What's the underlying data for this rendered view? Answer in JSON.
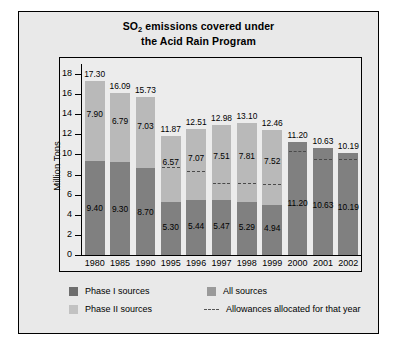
{
  "chart_data": {
    "type": "bar",
    "title": "SO2 emissions covered under the Acid Rain Program",
    "title_line1_pre": "SO",
    "title_line1_sub": "2",
    "title_line1_post": " emissions covered under",
    "title_line2": "the Acid Rain Program",
    "xlabel": "",
    "ylabel": "Million Tons",
    "ylim": [
      0,
      19
    ],
    "yticks": [
      0,
      2,
      4,
      6,
      8,
      10,
      12,
      14,
      16,
      18
    ],
    "grid": false,
    "legend_position": "bottom",
    "categories": [
      "1980",
      "1985",
      "1990",
      "1995",
      "1996",
      "1997",
      "1998",
      "1999",
      "2000",
      "2001",
      "2002"
    ],
    "series": [
      {
        "name": "Phase I sources",
        "color": "#808080",
        "values": [
          9.4,
          9.3,
          8.7,
          5.3,
          5.44,
          5.47,
          5.29,
          4.94,
          null,
          null,
          null
        ]
      },
      {
        "name": "Phase II sources",
        "color": "#b9b9b9",
        "values": [
          7.9,
          6.79,
          7.03,
          6.57,
          7.07,
          7.51,
          7.81,
          7.52,
          null,
          null,
          null
        ]
      },
      {
        "name": "All sources",
        "color": "#808080",
        "values": [
          null,
          null,
          null,
          null,
          null,
          null,
          null,
          null,
          11.2,
          10.63,
          10.19
        ]
      }
    ],
    "totals": [
      17.3,
      16.09,
      15.73,
      11.87,
      12.51,
      12.98,
      13.1,
      12.46,
      11.2,
      10.63,
      10.19
    ],
    "allowances_allocated": [
      null,
      null,
      null,
      8.7,
      8.3,
      7.1,
      7.1,
      7.0,
      10.2,
      9.5,
      9.5
    ],
    "annotations": {
      "total_labels": [
        "17.30",
        "16.09",
        "15.73",
        "11.87",
        "12.51",
        "12.98",
        "13.10",
        "12.46",
        "11.20",
        "10.63",
        "10.19"
      ],
      "upper_labels": [
        "7.90",
        "6.79",
        "7.03",
        "6.57",
        "7.07",
        "7.51",
        "7.81",
        "7.52",
        "",
        "",
        ""
      ],
      "lower_labels": [
        "9.40",
        "9.30",
        "8.70",
        "5.30",
        "5.44",
        "5.47",
        "5.29",
        "4.94",
        "11.20",
        "10.63",
        "10.19"
      ]
    },
    "legend": [
      {
        "label": "Phase I sources",
        "swatch": "phase-1"
      },
      {
        "label": "All sources",
        "swatch": "all-sources"
      },
      {
        "label": "Phase II sources",
        "swatch": "phase-2"
      },
      {
        "label": "Allowances allocated for that year",
        "swatch": "dashed-line"
      }
    ]
  },
  "colors": {
    "phase_1": "#808080",
    "phase_2": "#b9b9b9",
    "all_sources": "#808080",
    "allowance_line": "#4a4a4a",
    "panel_background": "#ececec",
    "figure_background": "#e9e9e9"
  }
}
